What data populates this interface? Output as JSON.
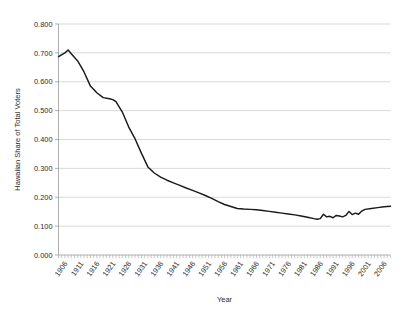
{
  "chart_data": {
    "type": "line",
    "title": "",
    "xlabel": "Year",
    "ylabel": "Hawaiian Share of Total Voters",
    "xlim": [
      1904,
      2008
    ],
    "ylim": [
      0.0,
      0.8
    ],
    "grid": true,
    "legend": null,
    "y_tick_labels": [
      "0.800",
      "0.700",
      "0.600",
      "0.500",
      "0.400",
      "0.300",
      "0.200",
      "0.100",
      "0.000"
    ],
    "y_tick_values": [
      0.8,
      0.7,
      0.6,
      0.5,
      0.4,
      0.3,
      0.2,
      0.1,
      0.0
    ],
    "x_tick_labels": [
      "1906",
      "1911",
      "1916",
      "1921",
      "1926",
      "1931",
      "1936",
      "1941",
      "1946",
      "1951",
      "1956",
      "1961",
      "1966",
      "1971",
      "1976",
      "1981",
      "1986",
      "1991",
      "1996",
      "2001",
      "2006"
    ],
    "x_tick_values": [
      1906,
      1911,
      1916,
      1921,
      1926,
      1931,
      1936,
      1941,
      1946,
      1951,
      1956,
      1961,
      1966,
      1971,
      1976,
      1981,
      1986,
      1991,
      1996,
      2001,
      2006
    ],
    "series": [
      {
        "name": "Hawaiian Share of Total Voters",
        "color": "#1a1a1a",
        "x": [
          1904,
          1906,
          1907,
          1908,
          1910,
          1912,
          1914,
          1916,
          1918,
          1920,
          1921,
          1922,
          1924,
          1926,
          1928,
          1930,
          1932,
          1934,
          1936,
          1938,
          1940,
          1942,
          1944,
          1946,
          1948,
          1950,
          1952,
          1954,
          1956,
          1958,
          1960,
          1961,
          1962,
          1964,
          1966,
          1968,
          1970,
          1972,
          1974,
          1976,
          1978,
          1980,
          1982,
          1984,
          1985,
          1986,
          1987,
          1988,
          1989,
          1990,
          1991,
          1992,
          1993,
          1994,
          1995,
          1996,
          1997,
          1998,
          1999,
          2000,
          2002,
          2004,
          2006,
          2008
        ],
        "values": [
          0.687,
          0.7,
          0.71,
          0.697,
          0.672,
          0.634,
          0.585,
          0.562,
          0.545,
          0.541,
          0.538,
          0.531,
          0.495,
          0.443,
          0.402,
          0.352,
          0.305,
          0.284,
          0.27,
          0.259,
          0.25,
          0.241,
          0.232,
          0.224,
          0.215,
          0.206,
          0.196,
          0.185,
          0.175,
          0.168,
          0.161,
          0.16,
          0.159,
          0.158,
          0.157,
          0.154,
          0.151,
          0.148,
          0.145,
          0.142,
          0.139,
          0.135,
          0.131,
          0.126,
          0.124,
          0.126,
          0.141,
          0.132,
          0.134,
          0.129,
          0.137,
          0.135,
          0.132,
          0.137,
          0.151,
          0.14,
          0.145,
          0.141,
          0.152,
          0.158,
          0.161,
          0.164,
          0.167,
          0.169
        ]
      }
    ]
  }
}
